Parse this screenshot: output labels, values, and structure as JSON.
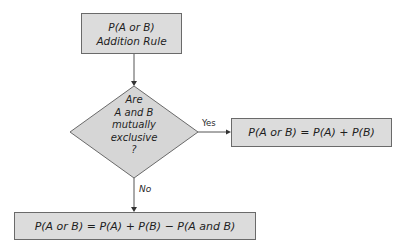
{
  "diagram": {
    "colors": {
      "box_fill": "#dcdcdc",
      "box_border": "#6a6a6a",
      "line": "#555555",
      "text": "#1e1e1e"
    },
    "start": {
      "line1": "P(A or B)",
      "line2": "Addition Rule"
    },
    "decision": {
      "lines": [
        "Are",
        "A and B",
        "mutually",
        "exclusive",
        "?"
      ]
    },
    "yes_branch": {
      "label": "Yes",
      "formula": "P(A or B) = P(A) + P(B)"
    },
    "no_branch": {
      "label": "No",
      "formula": "P(A or B) = P(A) + P(B) − P(A and B)"
    }
  }
}
